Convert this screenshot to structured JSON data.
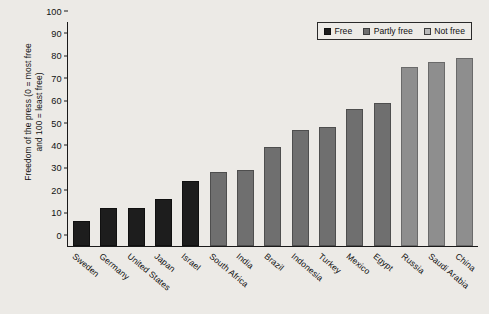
{
  "chart_data": {
    "type": "bar",
    "title": "",
    "xlabel": "",
    "ylabel": "Freedom of the press (0 = most free and 100 = least free)",
    "ylabel_line1": "Freedom of the press (0 = most free",
    "ylabel_line2": "and 100 = least free)",
    "ylim": [
      0,
      100
    ],
    "yticks": [
      0,
      10,
      20,
      30,
      40,
      50,
      60,
      70,
      80,
      90,
      100
    ],
    "grid": false,
    "legend_position": "top-right",
    "categories": [
      "Sweden",
      "Germany",
      "United States",
      "Japan",
      "Israel",
      "South Africa",
      "India",
      "Brazil",
      "Indonesia",
      "Turkey",
      "Mexico",
      "Egypt",
      "Russia",
      "Saudi Arabia",
      "China"
    ],
    "values": [
      11,
      17,
      17,
      21,
      29,
      33,
      34,
      44,
      52,
      53,
      61,
      64,
      80,
      82,
      84
    ],
    "categories_status": [
      "free",
      "free",
      "free",
      "free",
      "free",
      "partly",
      "partly",
      "partly",
      "partly",
      "partly",
      "partly",
      "partly",
      "notfree",
      "notfree",
      "notfree"
    ],
    "legend": [
      {
        "key": "free",
        "label": "Free",
        "color": "#1d1d1d"
      },
      {
        "key": "partly",
        "label": "Partly free",
        "color": "#6f6f6f"
      },
      {
        "key": "notfree",
        "label": "Not free",
        "color": "#b9b9b9"
      }
    ],
    "colors": {
      "background": "#eceae6",
      "axis": "#1a1a1a",
      "text": "#111111",
      "free": "#1d1d1d",
      "partly": "#6f6f6f",
      "notfree": "#8e8e8e"
    }
  }
}
